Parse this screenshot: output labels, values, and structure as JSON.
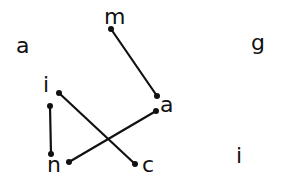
{
  "diagram": {
    "type": "hand-drawn letter matching",
    "stroke_color": "#111111",
    "background": "#ffffff",
    "labels": [
      {
        "id": "m",
        "text": "m",
        "x": 104,
        "y": 24
      },
      {
        "id": "a_left",
        "text": "a",
        "x": 16,
        "y": 53
      },
      {
        "id": "g",
        "text": "g",
        "x": 251,
        "y": 50
      },
      {
        "id": "i_left",
        "text": "i",
        "x": 43,
        "y": 92
      },
      {
        "id": "a_mid",
        "text": "a",
        "x": 160,
        "y": 112
      },
      {
        "id": "n",
        "text": "n",
        "x": 47,
        "y": 172
      },
      {
        "id": "c",
        "text": "c",
        "x": 142,
        "y": 172
      },
      {
        "id": "i_right",
        "text": "i",
        "x": 236,
        "y": 163
      }
    ],
    "connections": [
      {
        "from": "m",
        "to": "a_mid",
        "x1": 111,
        "y1": 29,
        "x2": 157,
        "y2": 96
      },
      {
        "from": "i_left",
        "to": "n",
        "x1": 50,
        "y1": 106,
        "x2": 51,
        "y2": 154
      },
      {
        "from": "i_left",
        "to": "c",
        "x1": 59,
        "y1": 93,
        "x2": 135,
        "y2": 164
      },
      {
        "from": "n",
        "to": "a_mid",
        "x1": 69,
        "y1": 162,
        "x2": 156,
        "y2": 111
      }
    ]
  }
}
